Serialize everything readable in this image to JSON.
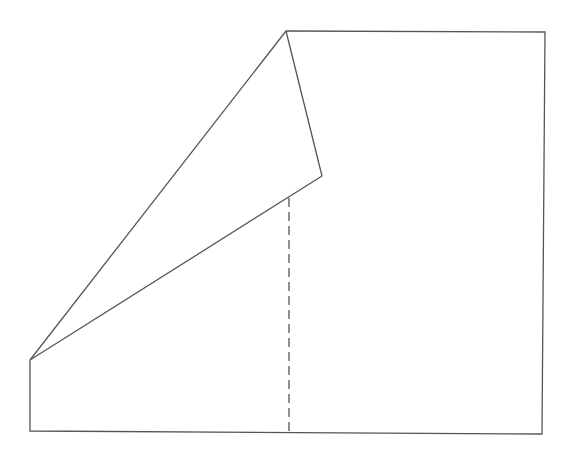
{
  "diagram": {
    "colors": {
      "stroke": "#555555",
      "background": "#ffffff"
    },
    "vertices": {
      "top_fold_vertex": [
        286,
        31
      ],
      "top_right": [
        545,
        32
      ],
      "bottom_right": [
        542,
        434
      ],
      "bottom_left": [
        30,
        431
      ],
      "left_fold_vertex": [
        30,
        360
      ],
      "folded_tip": [
        322,
        176
      ],
      "dashed_top": [
        289,
        198
      ],
      "dashed_bottom": [
        289,
        432
      ]
    },
    "labels": []
  }
}
